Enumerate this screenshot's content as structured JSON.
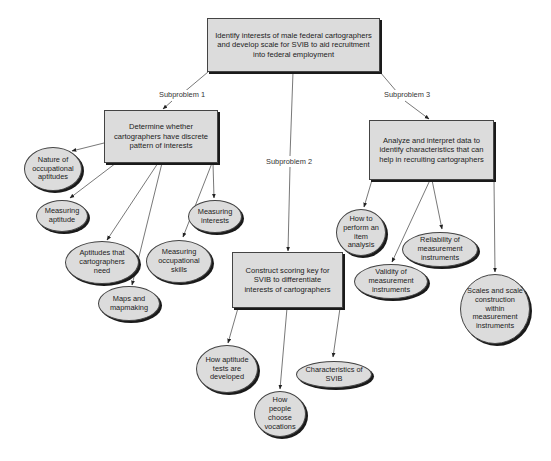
{
  "root": {
    "text": "Identify interests of male federal cartographers and develop scale for SVIB to aid recruitment into federal employment"
  },
  "subproblems": [
    {
      "label": "Subproblem 1",
      "box": "Determine whether cartographers have discrete pattern of interests",
      "topics": [
        "Nature of occupational aptitudes",
        "Measuring aptitude",
        "Aptitudes that cartographers need",
        "Maps and mapmaking",
        "Measuring occupational skills",
        "Measuring interests"
      ]
    },
    {
      "label": "Subproblem 2",
      "box": "Construct scoring key for SVIB to differentiate interests of cartographers",
      "topics": [
        "How aptitude tests are developed",
        "How people choose vocations",
        "Characteristics of SVIB"
      ]
    },
    {
      "label": "Subproblem 3",
      "box": "Analyze and interpret data to identify characteristics that can help in recruiting cartographers",
      "topics": [
        "How to perform an item analysis",
        "Reliability of measurement instruments",
        "Validity of measurement instruments",
        "Scales and scale construction within measurement instruments"
      ]
    }
  ],
  "colors": {
    "node_fill": "#dcdcdc",
    "node_border": "#444444",
    "shadow": "#1a1a1a",
    "connector": "#444444"
  }
}
